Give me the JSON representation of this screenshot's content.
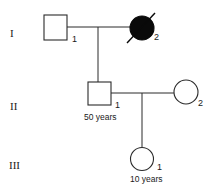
{
  "diagram": {
    "type": "pedigree",
    "generations": [
      {
        "label": "I"
      },
      {
        "label": "II"
      },
      {
        "label": "III"
      }
    ],
    "individuals": [
      {
        "id": "I-1",
        "generation": "I",
        "number": "1",
        "sex": "male",
        "affected": false,
        "deceased": false,
        "age": ""
      },
      {
        "id": "I-2",
        "generation": "I",
        "number": "2",
        "sex": "female",
        "affected": true,
        "deceased": true,
        "age": ""
      },
      {
        "id": "II-1",
        "generation": "II",
        "number": "1",
        "sex": "male",
        "affected": false,
        "deceased": false,
        "age": "50 years"
      },
      {
        "id": "II-2",
        "generation": "II",
        "number": "2",
        "sex": "female",
        "affected": false,
        "deceased": false,
        "age": ""
      },
      {
        "id": "III-1",
        "generation": "III",
        "number": "1",
        "sex": "female",
        "affected": false,
        "deceased": false,
        "age": "10 years"
      }
    ],
    "relationships": [
      {
        "partners": [
          "I-1",
          "I-2"
        ],
        "children": [
          "II-1"
        ]
      },
      {
        "partners": [
          "II-1",
          "II-2"
        ],
        "children": [
          "III-1"
        ]
      }
    ],
    "colors": {
      "line": "#2a2a2a",
      "affected_fill": "#0a0a0a",
      "background": "#ffffff"
    }
  }
}
